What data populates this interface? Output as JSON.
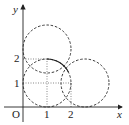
{
  "diagram": {
    "type": "coordinate-plane-circles",
    "axes": {
      "x_label": "x",
      "y_label": "y",
      "origin_label": "O",
      "x_ticks": [
        "1",
        "2"
      ],
      "y_ticks": [
        "1",
        "2"
      ]
    },
    "circles": [
      {
        "name": "main-circle",
        "center": [
          1,
          1
        ],
        "radius": 1,
        "style": "dashed with solid upper-right arc"
      },
      {
        "name": "upper-circle",
        "center": [
          1,
          2.4
        ],
        "radius": 1,
        "style": "dashed"
      },
      {
        "name": "right-circle",
        "center": [
          2.6,
          1
        ],
        "radius": 1,
        "style": "dashed"
      }
    ],
    "guide_lines": [
      {
        "from": [
          0,
          2
        ],
        "to": [
          1,
          2
        ],
        "style": "dotted"
      },
      {
        "from": [
          0,
          1
        ],
        "to": [
          2,
          1
        ],
        "style": "dotted"
      },
      {
        "from": [
          1,
          0
        ],
        "to": [
          1,
          2
        ],
        "style": "dotted"
      },
      {
        "from": [
          2,
          0
        ],
        "to": [
          2,
          1
        ],
        "style": "dotted"
      }
    ],
    "colors": {
      "stroke": "#222222",
      "background": "#ffffff"
    }
  }
}
